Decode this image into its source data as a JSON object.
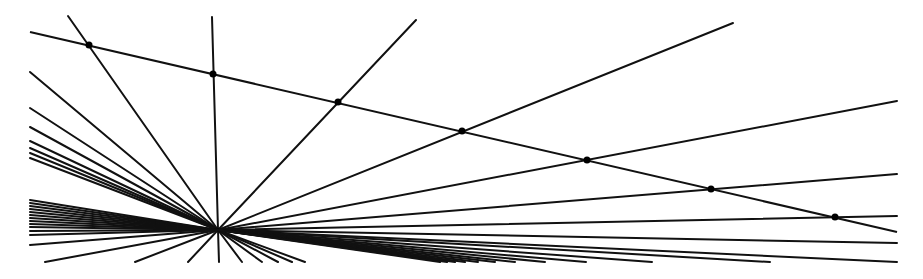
{
  "diagram": {
    "title": "",
    "colors": {
      "line": "#111111",
      "dot": "#000000",
      "background": "#ffffff"
    },
    "vanishing_point": [
      218,
      230
    ],
    "transversal": {
      "from": [
        30,
        32
      ],
      "to": [
        897,
        232
      ]
    },
    "marked_points": [
      [
        89,
        45
      ],
      [
        213,
        74
      ],
      [
        338,
        102
      ],
      [
        462,
        131
      ],
      [
        587,
        160
      ],
      [
        711,
        189
      ],
      [
        835,
        217
      ]
    ],
    "upper_rays": [
      [
        68,
        16
      ],
      [
        212,
        17
      ],
      [
        416,
        20
      ],
      [
        733,
        23
      ],
      [
        897,
        101
      ],
      [
        897,
        174
      ],
      [
        897,
        216
      ]
    ],
    "left_rays": [
      [
        30,
        72
      ],
      [
        30,
        108
      ],
      [
        30,
        127
      ],
      [
        30,
        141
      ],
      [
        30,
        148
      ],
      [
        30,
        153
      ],
      [
        30,
        158
      ]
    ],
    "left_dense_rays": [
      [
        30,
        200
      ],
      [
        30,
        203
      ],
      [
        30,
        206
      ],
      [
        30,
        209
      ],
      [
        30,
        212
      ],
      [
        30,
        215
      ],
      [
        30,
        218
      ],
      [
        30,
        221
      ],
      [
        30,
        224
      ],
      [
        30,
        227
      ],
      [
        30,
        231
      ],
      [
        30,
        235
      ],
      [
        30,
        245
      ],
      [
        45,
        262
      ],
      [
        135,
        262
      ]
    ],
    "lower_rays": [
      [
        188,
        262
      ],
      [
        219,
        262
      ],
      [
        242,
        262
      ],
      [
        262,
        262
      ],
      [
        278,
        262
      ],
      [
        292,
        262
      ],
      [
        305,
        262
      ]
    ],
    "right_rays": [
      [
        897,
        243
      ],
      [
        897,
        262
      ],
      [
        770,
        262
      ],
      [
        652,
        262
      ],
      [
        586,
        262
      ],
      [
        545,
        262
      ],
      [
        515,
        262
      ],
      [
        495,
        262
      ],
      [
        478,
        262
      ],
      [
        465,
        262
      ],
      [
        455,
        262
      ],
      [
        447,
        262
      ],
      [
        440,
        262
      ]
    ],
    "stroke_width": 2,
    "dot_radius": 3.5
  }
}
